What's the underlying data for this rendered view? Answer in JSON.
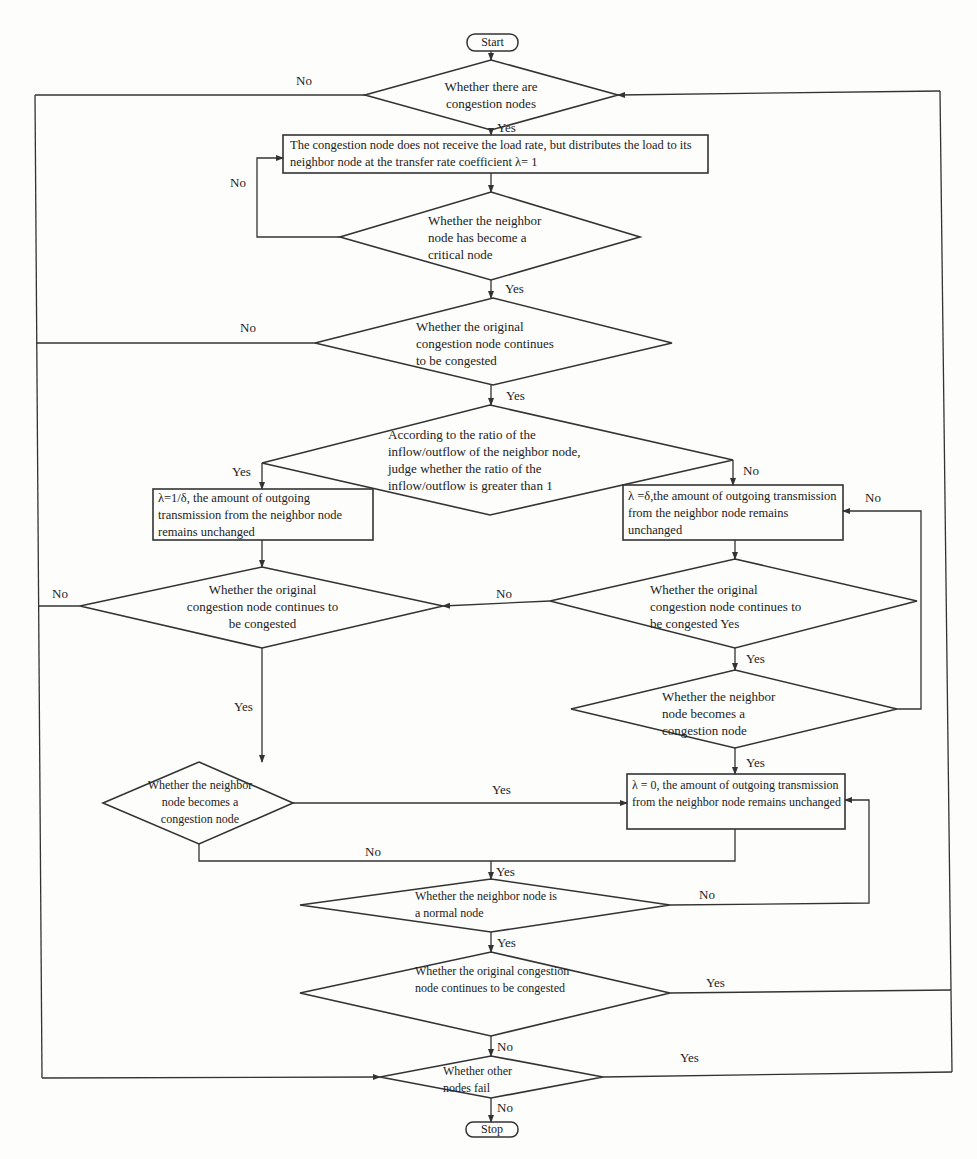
{
  "diagram": {
    "type": "flowchart",
    "colors": {
      "line": "#333333",
      "text": "#222222",
      "background": "#fdfdfc"
    },
    "terminals": {
      "start": "Start",
      "stop": "Stop"
    },
    "decisions": {
      "d1": "Whether there are congestion nodes",
      "d2": "Whether the neighbor node has become a critical node",
      "d3": "Whether the original congestion node continues to be congested",
      "d4": "According to the ratio of the inflow/outflow of the neighbor node, judge whether the ratio of the inflow/outflow is greater than 1",
      "d5": "Whether the original congestion node continues to be congested",
      "d6": "Whether the original congestion  node continues to be congested Yes",
      "d7": "Whether the neighbor node  becomes a congestion node",
      "d8": "Whether the neighbor node becomes a congestion node",
      "d9": "Whether the neighbor node is a normal node",
      "d10": "Whether the original congestion node continues to be congested",
      "d11": "Whether other nodes fail"
    },
    "processes": {
      "p1": "The congestion node does not receive the load rate, but distributes the load to its neighbor node at the transfer rate coefficient λ= 1",
      "p2": "λ=1/δ,   the amount of outgoing transmission from the neighbor node remains unchanged",
      "p3": "λ =δ,the amount of outgoing transmission from the neighbor node remains unchanged",
      "p4": "λ = 0,   the amount of outgoing transmission from the neighbor node remains unchanged"
    },
    "edge_labels": {
      "d1_no": "No",
      "d1_yes": "Yes",
      "d2_no": "No",
      "d2_yes": "Yes",
      "d3_no": "No",
      "d3_yes": "Yes",
      "d4_yes": "Yes",
      "d4_no": "No",
      "d6_no": "No",
      "d5_no": "No",
      "d5_yes": "Yes",
      "d6_yes": "Yes",
      "d7_no": "No",
      "d7_yes": "Yes",
      "d8_yes": "Yes",
      "d8_no": "No",
      "merge_yes": "Yes",
      "d9_no": "No",
      "d9_yes": "Yes",
      "d10_yes": "Yes",
      "d10_no": "No",
      "d11_yes": "Yes",
      "d11_no": "No"
    }
  }
}
